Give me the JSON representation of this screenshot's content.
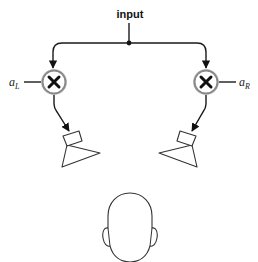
{
  "diagram": {
    "input_label": "input",
    "left_channel": {
      "gain_label": "a",
      "gain_subscript": "L",
      "multiplier_symbol": "×",
      "speaker": "left-speaker"
    },
    "right_channel": {
      "gain_label": "a",
      "gain_subscript": "R",
      "multiplier_symbol": "×",
      "speaker": "right-speaker"
    },
    "listener": "head",
    "colors": {
      "line": "#1a1a1a",
      "node_ring": "#9a9a9a",
      "background": "#ffffff"
    }
  }
}
